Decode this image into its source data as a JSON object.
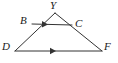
{
  "figure": {
    "type": "geometry-diagram",
    "width": 118,
    "height": 63,
    "background_color": "#ffffff",
    "stroke_color": "#333333",
    "label_color": "#1a1a1a",
    "points": [
      {
        "id": "Y",
        "label": "Y",
        "x": 55,
        "y": 13,
        "label_x": 50,
        "label_y": 0
      },
      {
        "id": "B",
        "label": "B",
        "x": 32,
        "y": 24,
        "label_x": 20,
        "label_y": 15
      },
      {
        "id": "C",
        "label": "C",
        "x": 72,
        "y": 25,
        "label_x": 75,
        "label_y": 18
      },
      {
        "id": "D",
        "label": "D",
        "x": 15,
        "y": 51,
        "label_x": 2,
        "label_y": 41
      },
      {
        "id": "F",
        "label": "F",
        "x": 102,
        "y": 51,
        "label_x": 104,
        "label_y": 41
      }
    ],
    "segments": [
      {
        "id": "YD",
        "from": "Y",
        "to": "D",
        "x1": 55,
        "y1": 13,
        "x2": 15,
        "y2": 51,
        "tick_marks": 0
      },
      {
        "id": "YF",
        "from": "Y",
        "to": "F",
        "x1": 55,
        "y1": 13,
        "x2": 102,
        "y2": 51,
        "tick_marks": 0
      },
      {
        "id": "BC",
        "from": "B",
        "to": "C",
        "x1": 32,
        "y1": 24,
        "x2": 72,
        "y2": 25,
        "tick_marks": 1
      },
      {
        "id": "DF",
        "from": "D",
        "to": "F",
        "x1": 15,
        "y1": 51,
        "x2": 102,
        "y2": 51,
        "tick_marks": 1
      }
    ],
    "parallel_marks": [
      {
        "id": "arrow-bc",
        "on_segment": "BC",
        "x": 48,
        "y": 24.4,
        "angle": 1.4,
        "count": 1
      },
      {
        "id": "arrow-df",
        "on_segment": "DF",
        "x": 56,
        "y": 51,
        "angle": 0,
        "count": 1
      }
    ]
  }
}
